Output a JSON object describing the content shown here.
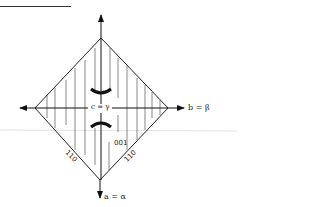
{
  "diagram": {
    "type": "crystal-axes-optical-orientation",
    "axes": {
      "horizontal_label": "b = β",
      "vertical_bottom_label": "a = α",
      "center_label": "c = γ"
    },
    "faces": {
      "center_face": "001",
      "left_edge_face": "110",
      "right_edge_face": "110"
    },
    "shape": "rhombus (square rotated 45°) with vertical hatching",
    "features": [
      "optic-axis hyperbola isogyres (two arcs above and below center)"
    ],
    "colors": {
      "line": "#222222",
      "hatch": "#555555",
      "background": "#ffffff"
    }
  }
}
